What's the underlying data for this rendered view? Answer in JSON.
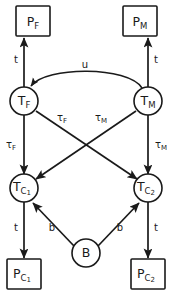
{
  "diagram": {
    "background_color": "#ffffff",
    "stroke_color": "#1a1a1a",
    "nodes": [
      {
        "id": "PF",
        "shape": "square",
        "symbol": "P",
        "subscript": "F",
        "label": "P_F",
        "x": 33,
        "y": 21
      },
      {
        "id": "PM",
        "shape": "square",
        "symbol": "P",
        "subscript": "M",
        "label": "P_M",
        "x": 140,
        "y": 21
      },
      {
        "id": "TF",
        "shape": "circle",
        "symbol": "T",
        "subscript": "F",
        "label": "T_F",
        "x": 24,
        "y": 101
      },
      {
        "id": "TM",
        "shape": "circle",
        "symbol": "T",
        "subscript": "M",
        "label": "T_M",
        "x": 148,
        "y": 101
      },
      {
        "id": "TC1",
        "shape": "circle",
        "symbol": "T",
        "subscript": "C",
        "subsub": "1",
        "label": "T_C1",
        "x": 24,
        "y": 188
      },
      {
        "id": "TC2",
        "shape": "circle",
        "symbol": "T",
        "subscript": "C",
        "subsub": "2",
        "label": "T_C2",
        "x": 148,
        "y": 188
      },
      {
        "id": "B",
        "shape": "circle",
        "symbol": "B",
        "subscript": "",
        "label": "B",
        "x": 86,
        "y": 253
      },
      {
        "id": "PC1",
        "shape": "square",
        "symbol": "P",
        "subscript": "C",
        "subsub": "1",
        "label": "P_C1",
        "x": 24,
        "y": 274
      },
      {
        "id": "PC2",
        "shape": "square",
        "symbol": "P",
        "subscript": "C",
        "subsub": "2",
        "label": "P_C2",
        "x": 148,
        "y": 274
      }
    ],
    "edges": [
      {
        "id": "TF-PF",
        "from": "TF",
        "to": "PF",
        "label": "t",
        "sub": "",
        "label_x": 16,
        "label_y": 60,
        "kind": "straight"
      },
      {
        "id": "TM-PM",
        "from": "TM",
        "to": "PM",
        "label": "t",
        "sub": "",
        "label_x": 156,
        "label_y": 60,
        "kind": "straight"
      },
      {
        "id": "TM-TF",
        "from": "TM",
        "to": "TF",
        "label": "u",
        "sub": "",
        "label_x": 85,
        "label_y": 65,
        "kind": "curve"
      },
      {
        "id": "TF-TC1",
        "from": "TF",
        "to": "TC1",
        "label": "τ",
        "sub": "F",
        "label_x": 11,
        "label_y": 145,
        "kind": "straight"
      },
      {
        "id": "TM-TC2",
        "from": "TM",
        "to": "TC2",
        "label": "τ",
        "sub": "M",
        "label_x": 161,
        "label_y": 145,
        "kind": "straight"
      },
      {
        "id": "TF-TC2",
        "from": "TF",
        "to": "TC2",
        "label": "τ",
        "sub": "F",
        "label_x": 62,
        "label_y": 118,
        "kind": "diagonal"
      },
      {
        "id": "TM-TC1",
        "from": "TM",
        "to": "TC1",
        "label": "τ",
        "sub": "M",
        "label_x": 101,
        "label_y": 118,
        "kind": "diagonal"
      },
      {
        "id": "B-TC1",
        "from": "B",
        "to": "TC1",
        "label": "b",
        "sub": "",
        "label_x": 52,
        "label_y": 228,
        "kind": "straight"
      },
      {
        "id": "B-TC2",
        "from": "B",
        "to": "TC2",
        "label": "b",
        "sub": "",
        "label_x": 120,
        "label_y": 228,
        "kind": "straight"
      },
      {
        "id": "TC1-PC1",
        "from": "TC1",
        "to": "PC1",
        "label": "t",
        "sub": "",
        "label_x": 16,
        "label_y": 228,
        "kind": "straight"
      },
      {
        "id": "TC2-PC2",
        "from": "TC2",
        "to": "PC2",
        "label": "t",
        "sub": "",
        "label_x": 156,
        "label_y": 228,
        "kind": "straight"
      }
    ]
  }
}
